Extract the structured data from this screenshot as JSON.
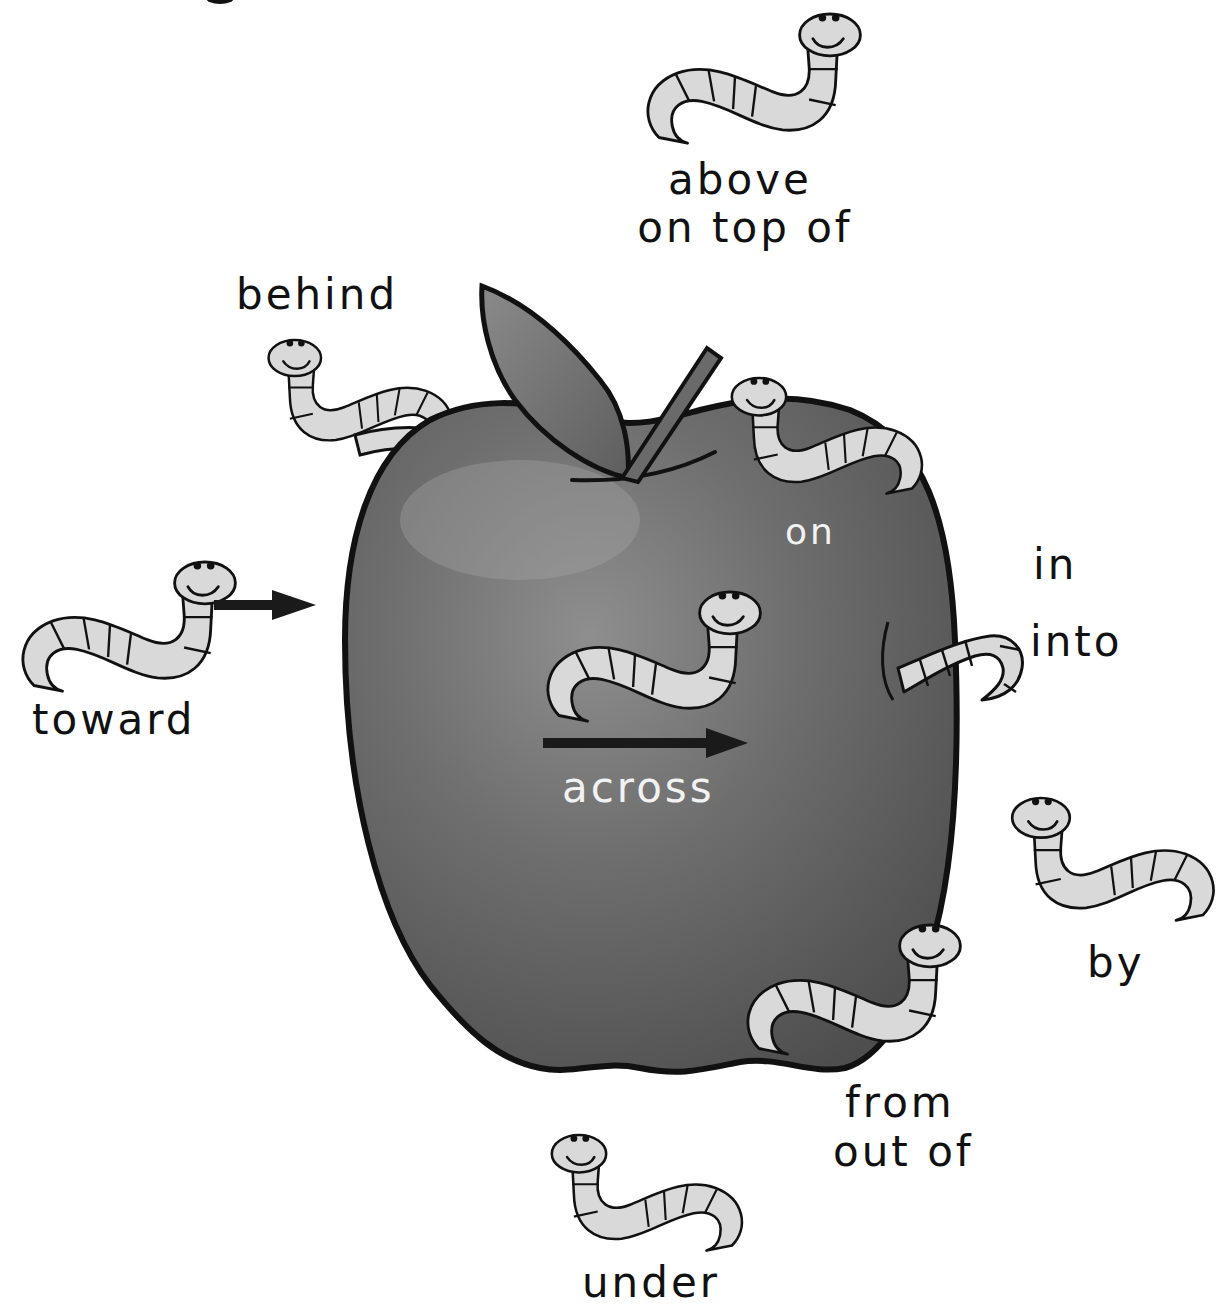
{
  "colors": {
    "apple_dark": "#4a4a4a",
    "apple_mid": "#6e6e6e",
    "apple_light": "#9a9a9a",
    "outline": "#111111",
    "worm_fill": "#d9d9d9",
    "arrow": "#1a1a1a",
    "label_dark": "#111111",
    "label_light": "#f2f2f2"
  },
  "labels": {
    "above": "above",
    "on_top_of": "on top of",
    "behind": "behind",
    "on": "on",
    "in": "in",
    "into": "into",
    "toward": "toward",
    "across": "across",
    "by": "by",
    "from": "from",
    "out_of": "out of",
    "under": "under"
  },
  "icons": [
    "worm-icon",
    "apple-icon",
    "right-arrow-icon",
    "leaf-icon",
    "stem-icon"
  ]
}
